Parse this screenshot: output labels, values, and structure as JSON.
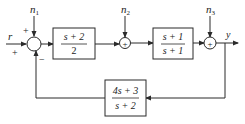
{
  "diagram": {
    "type": "block-diagram",
    "inputs": {
      "reference": "r",
      "noise_1": "n",
      "noise_1_sub": "1",
      "noise_2": "n",
      "noise_2_sub": "2",
      "noise_3": "n",
      "noise_3_sub": "3"
    },
    "output": "y",
    "summing_junctions": [
      {
        "id": "sum1",
        "signs": {
          "top": "+",
          "left": "+",
          "bottom": "−"
        }
      },
      {
        "id": "sum2",
        "symbol": "+"
      },
      {
        "id": "sum3",
        "symbol": "+"
      }
    ],
    "blocks": [
      {
        "id": "controller",
        "numerator": "s + 2",
        "denominator": "2"
      },
      {
        "id": "plant",
        "numerator": "s + 1",
        "denominator": "s + 1"
      },
      {
        "id": "feedback",
        "numerator": "4s + 3",
        "denominator": "s + 2"
      }
    ],
    "colors": {
      "line": "#2a2a2a",
      "background": "#ffffff"
    }
  }
}
